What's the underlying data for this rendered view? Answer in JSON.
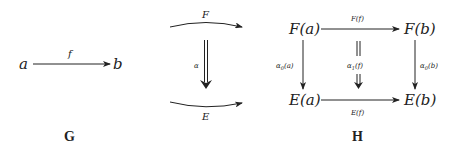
{
  "diagrams": {
    "G": {
      "caption": "G",
      "objects": {
        "source": "a",
        "target": "b"
      },
      "morphism": {
        "label": "f"
      }
    },
    "middle": {
      "top_functor": "F",
      "bottom_functor": "E",
      "natural_transformation": "α"
    },
    "H": {
      "caption": "H",
      "top_left": "F(a)",
      "top_right": "F(b)",
      "bottom_left": "E(a)",
      "bottom_right": "E(b)",
      "top_arrow_label": "F(f)",
      "bottom_arrow_label": "E(f)",
      "left_arrow_label": {
        "base": "α",
        "sub": "0",
        "arg": "(a)"
      },
      "right_arrow_label": {
        "base": "α",
        "sub": "0",
        "arg": "(b)"
      },
      "middle_label": {
        "base": "α",
        "sub": "1",
        "arg": "(f)"
      },
      "middle_equals": "||",
      "middle_double_arrow": "⇓"
    }
  },
  "colors": {
    "ink": "#222222",
    "background": "#ffffff"
  }
}
